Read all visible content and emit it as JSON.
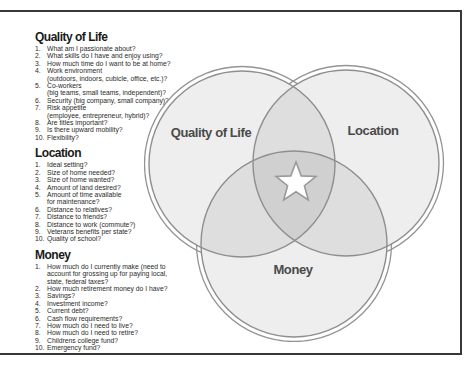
{
  "sections": [
    {
      "title": "Quality of Life",
      "items": [
        {
          "n": "1.",
          "text": "What am I passionate about?"
        },
        {
          "n": "2.",
          "text": "What skills do I have and enjoy using?"
        },
        {
          "n": "3.",
          "text": "How much time do I want to be at home?"
        },
        {
          "n": "4.",
          "text": "Work environment\n(outdoors, indoors, cubicle, office, etc.)?"
        },
        {
          "n": "5.",
          "text": "Co-workers\n(big teams, small teams, independent)?"
        },
        {
          "n": "6.",
          "text": "Security (big company, small company)?"
        },
        {
          "n": "7.",
          "text": "Risk appetite\n(employee, entrepreneur, hybrid)?"
        },
        {
          "n": "8.",
          "text": "Are titles important?"
        },
        {
          "n": "9.",
          "text": "Is there upward mobility?"
        },
        {
          "n": "10.",
          "text": "Flexibility?"
        }
      ]
    },
    {
      "title": "Location",
      "items": [
        {
          "n": "1.",
          "text": "Ideal setting?"
        },
        {
          "n": "2.",
          "text": "Size of home needed?"
        },
        {
          "n": "3.",
          "text": "Size of home wanted?"
        },
        {
          "n": "4.",
          "text": "Amount of land desired?"
        },
        {
          "n": "5.",
          "text": "Amount of time available\nfor maintenance?"
        },
        {
          "n": "6.",
          "text": "Distance to relatives?"
        },
        {
          "n": "7.",
          "text": "Distance to friends?"
        },
        {
          "n": "8.",
          "text": "Distance to work (commute?)"
        },
        {
          "n": "9.",
          "text": "Veterans benefits per state?"
        },
        {
          "n": "10.",
          "text": "Quality of school?"
        }
      ]
    },
    {
      "title": "Money",
      "items": [
        {
          "n": "1.",
          "text": "How much do I currently make (need to\naccount for grossing up for paying local,\nstate, federal taxes?"
        },
        {
          "n": "2.",
          "text": "How much retirement money do I have?"
        },
        {
          "n": "3.",
          "text": "Savings?"
        },
        {
          "n": "4.",
          "text": "Investment income?"
        },
        {
          "n": "5.",
          "text": "Current debt?"
        },
        {
          "n": "6.",
          "text": "Cash flow requirements?"
        },
        {
          "n": "7.",
          "text": "How much do I need to live?"
        },
        {
          "n": "8.",
          "text": "How much do I need to retire?"
        },
        {
          "n": "9.",
          "text": "Childrens college fund?"
        },
        {
          "n": "10.",
          "text": "Emergency fund?"
        }
      ]
    }
  ],
  "venn": {
    "circles": [
      {
        "label": "Quality of Life"
      },
      {
        "label": "Location"
      },
      {
        "label": "Money"
      }
    ],
    "center_icon": "star-icon"
  },
  "colors": {
    "frame_border": "#383838",
    "circle_stroke": "#8e8e8e",
    "circle_fill_single": "#f0f0f0",
    "circle_fill_double": "#e2e2e2",
    "circle_fill_triple": "#d5d5d5",
    "label_color": "#4a4a4a",
    "star_fill": "#ffffff",
    "star_stroke": "#9a9a9a"
  }
}
